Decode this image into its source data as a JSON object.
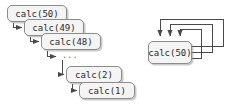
{
  "diagram": {
    "background_color": "#ffffff",
    "node_fill_color": "#f4f4f4",
    "node_border_color": "#8c8c8c",
    "arrow_color": "#4a4a4a",
    "text_color": "#2b2b2b",
    "ellipsis_label": "..."
  },
  "left_stack": {
    "name": "recursive-call-chain",
    "nodes": [
      {
        "label": "calc(50)",
        "x": 7,
        "y": 5,
        "w": 60,
        "h": 17
      },
      {
        "label": "calc(49)",
        "x": 24,
        "y": 19,
        "w": 60,
        "h": 17
      },
      {
        "label": "calc(48)",
        "x": 41,
        "y": 33,
        "w": 60,
        "h": 17
      },
      {
        "label": "calc(2)",
        "x": 66,
        "y": 66,
        "w": 56,
        "h": 17
      },
      {
        "label": "calc(1)",
        "x": 79,
        "y": 82,
        "w": 56,
        "h": 17
      }
    ],
    "ellipsis": {
      "label": "...",
      "x": 62,
      "y": 53
    },
    "arrows": [
      {
        "name": "arrow-calc50-to-calc49"
      },
      {
        "name": "arrow-calc49-to-calc48"
      },
      {
        "name": "arrow-calc48-to-ellipsis"
      },
      {
        "name": "arrow-ellipsis-to-calc2"
      },
      {
        "name": "arrow-calc2-to-calc1"
      }
    ]
  },
  "right_group": {
    "name": "self-recursive-node",
    "node": {
      "label": "calc(50)",
      "x": 148,
      "y": 41,
      "w": 44,
      "h": 23
    },
    "loops": [
      {
        "name": "self-loop-inner",
        "right_x": 201,
        "top_y": 29,
        "arrow_x": 180
      },
      {
        "name": "self-loop-middle",
        "right_x": 212,
        "top_y": 24,
        "arrow_x": 170
      },
      {
        "name": "self-loop-outer",
        "right_x": 223,
        "top_y": 19,
        "arrow_x": 160
      }
    ]
  }
}
